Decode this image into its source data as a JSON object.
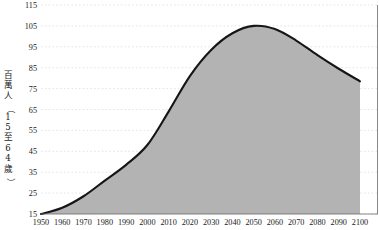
{
  "chart_data": {
    "type": "area",
    "title": "",
    "xlabel": "",
    "ylabel": "百萬人（15至64歲）",
    "ylabel_chars": [
      "百",
      "萬",
      "人",
      "（",
      "1",
      "5",
      "至",
      "6",
      "4",
      "歲",
      "）"
    ],
    "x": [
      1950,
      1960,
      1970,
      1980,
      1990,
      2000,
      2010,
      2020,
      2030,
      2040,
      2050,
      2060,
      2070,
      2080,
      2090,
      2100
    ],
    "values": [
      15.0,
      18.0,
      23.5,
      31.0,
      38.5,
      48.0,
      64.0,
      81.0,
      93.5,
      101.5,
      105.0,
      103.5,
      98.0,
      91.0,
      84.5,
      78.5
    ],
    "xticklabels": [
      "1950",
      "1960",
      "1970",
      "1980",
      "1990",
      "2000",
      "2010",
      "2020",
      "2030",
      "2040",
      "2050",
      "2060",
      "2070",
      "2080",
      "2090",
      "2100"
    ],
    "yticks": [
      15,
      25,
      35,
      45,
      55,
      65,
      75,
      85,
      95,
      105,
      115
    ],
    "yticklabels": [
      "15",
      "25",
      "35",
      "45",
      "55",
      "65",
      "75",
      "85",
      "95",
      "105",
      "115"
    ],
    "xlim": [
      1950,
      2100
    ],
    "ylim": [
      15,
      115
    ],
    "grid": true,
    "grid_axis": "y",
    "legend": false,
    "legend_position": "none",
    "peak": {
      "year": 2050,
      "value": 105.0
    },
    "colors": {
      "fill": "#b3b3b3",
      "stroke": "#161616",
      "grid": "#d8d8d8",
      "axis": "#6b6b6b",
      "text": "#1a1a1a",
      "background": "#ffffff"
    }
  }
}
